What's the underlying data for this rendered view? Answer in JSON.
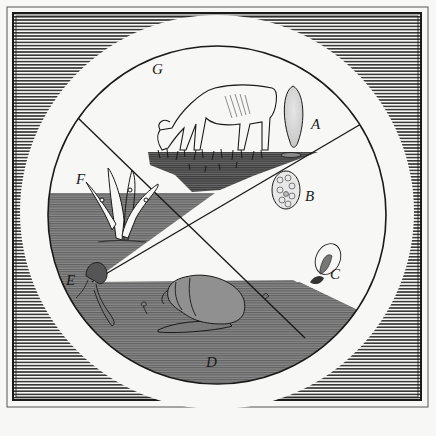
{
  "figure": {
    "colors": {
      "paper": "#f7f7f5",
      "ink": "#1a1a1a",
      "hatch": "#3a3a3a",
      "water_gray": "#7a7a7a",
      "grass_gray": "#5e5e5e",
      "ring_white": "#f7f7f5"
    },
    "labels": {
      "A": "A",
      "B": "B",
      "C": "C",
      "D": "D",
      "E": "E",
      "F": "F",
      "G": "G"
    },
    "stages": [
      {
        "key": "G",
        "depiction": "cow grazing on grass"
      },
      {
        "key": "A",
        "depiction": "adult fluke (stippled leaf shape)"
      },
      {
        "key": "B",
        "depiction": "egg (oval with cellular pattern)"
      },
      {
        "key": "C",
        "depiction": "ciliated larva (miracidium) in oval"
      },
      {
        "key": "D",
        "depiction": "pond snail in water"
      },
      {
        "key": "E",
        "depiction": "redia / cercaria larva with tail"
      },
      {
        "key": "F",
        "depiction": "grass blades with encysted larvae"
      }
    ]
  }
}
